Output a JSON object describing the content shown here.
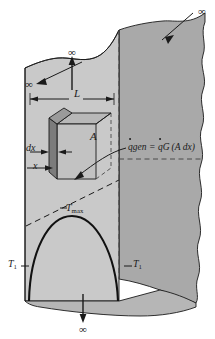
{
  "figure": {
    "colors": {
      "front_face": "#c9c9c9",
      "side_face": "#a9a9a9",
      "element_face": "#8d8d8d",
      "element_top": "#b8b8b8",
      "element_side": "#707070",
      "outline": "#1a1a1a",
      "background": "#ffffff"
    }
  },
  "labels": {
    "length": "L",
    "area": "A",
    "thickness_element": "dx",
    "position": "x",
    "max_temperature": {
      "base": "T",
      "sub": "max"
    },
    "surface_temperature_left": {
      "base": "T",
      "sub": "1"
    },
    "surface_temperature_right": {
      "base": "T",
      "sub": "1"
    },
    "infinity": "∞"
  },
  "equation": {
    "lhs": {
      "base": "q",
      "sub": "gen",
      "dot": true
    },
    "equals": "=",
    "rhs": {
      "base": "q",
      "sub": "G",
      "dot": true
    },
    "rhs_group": "(A dx)",
    "plain_text": "q̇_gen = q̇_G (A dx)"
  },
  "annotations": {
    "infinity_top_right": "∞",
    "infinity_top_middle": "∞",
    "infinity_left": "∞",
    "infinity_bottom": "∞"
  }
}
